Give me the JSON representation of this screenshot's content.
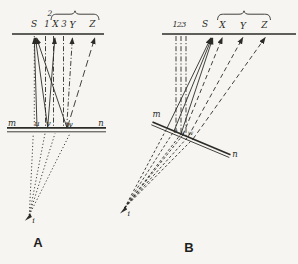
{
  "figure": {
    "type": "optics-mirror-ray-diagram",
    "colors": {
      "paper": "#f6f5f1",
      "ink": "#2b2b28"
    },
    "panel_a": {
      "caption": "A",
      "top_labels": {
        "S": "S",
        "one": "1",
        "two": "2",
        "X": "X",
        "three": "3",
        "Y": "Y",
        "Z": "Z"
      },
      "mirror_labels": {
        "m": "m",
        "u": "u",
        "v": "v",
        "w": "w",
        "n": "n"
      },
      "image_point": "i"
    },
    "panel_b": {
      "caption": "B",
      "top_labels": {
        "one": "1",
        "two": "2",
        "three": "3",
        "S": "S",
        "X": "X",
        "Y": "Y",
        "Z": "Z"
      },
      "mirror_labels": {
        "m": "m",
        "u": "u",
        "v": "v",
        "w": "w",
        "n": "n"
      },
      "image_point": "i"
    }
  }
}
